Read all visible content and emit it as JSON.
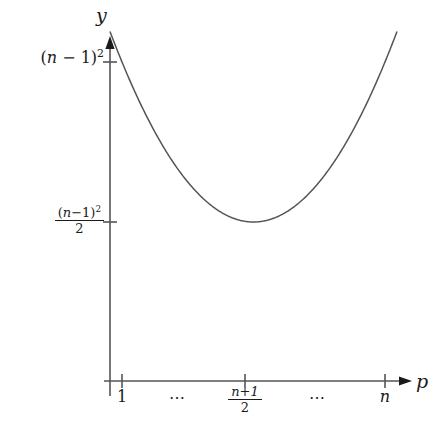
{
  "figure": {
    "background_color": "#ffffff",
    "ink_color": "#1a1a1a",
    "axes": {
      "y_axis_label": "y",
      "x_axis_label": "p"
    },
    "y_ticks": [
      {
        "id": "top",
        "label": "(n − 1)²",
        "numerator": "(n−1)",
        "exponent": "2",
        "denominator": null
      },
      {
        "id": "mid",
        "label": "(n−1)² / 2",
        "numerator": "(n−1)",
        "exponent": "2",
        "denominator": "2"
      }
    ],
    "x_ticks": [
      {
        "id": "left",
        "label": "1"
      },
      {
        "id": "dots-left",
        "label": "⋯"
      },
      {
        "id": "mid",
        "numerator": "n+1",
        "denominator": "2",
        "label": "(n+1)/2"
      },
      {
        "id": "dots-right",
        "label": "⋯"
      },
      {
        "id": "right",
        "label": "n"
      }
    ]
  },
  "chart_data": {
    "type": "line",
    "title": "",
    "xlabel": "p",
    "ylabel": "y",
    "grid": false,
    "legend": null,
    "xtick_labels": [
      "1",
      "⋯",
      "(n+1)/2",
      "⋯",
      "n"
    ],
    "xtick_positions": [
      1,
      1.5,
      2,
      2.5,
      3
    ],
    "ytick_labels": [
      "(n−1)²/2",
      "(n−1)²"
    ],
    "ytick_values": [
      0.5,
      1.0
    ],
    "xlim": [
      0.85,
      3.25
    ],
    "ylim": [
      0,
      1.12
    ],
    "series": [
      {
        "name": "y = 2(p−1)(n−p) expected-cost curve",
        "shape": "parabola (upward, symmetric about (n+1)/2)",
        "vertex": {
          "x": 2,
          "y": 0.5
        },
        "endpoints": [
          {
            "x": 1,
            "y": 1.0
          },
          {
            "x": 3,
            "y": 1.0
          }
        ],
        "x": [
          1.0,
          1.1,
          1.2,
          1.3,
          1.4,
          1.5,
          1.6,
          1.7,
          1.8,
          1.9,
          2.0,
          2.1,
          2.2,
          2.3,
          2.4,
          2.5,
          2.6,
          2.7,
          2.8,
          2.9,
          3.0
        ],
        "values": [
          1.0,
          0.905,
          0.82,
          0.745,
          0.68,
          0.625,
          0.58,
          0.545,
          0.52,
          0.505,
          0.5,
          0.505,
          0.52,
          0.545,
          0.58,
          0.625,
          0.68,
          0.745,
          0.82,
          0.905,
          1.0
        ]
      }
    ]
  }
}
